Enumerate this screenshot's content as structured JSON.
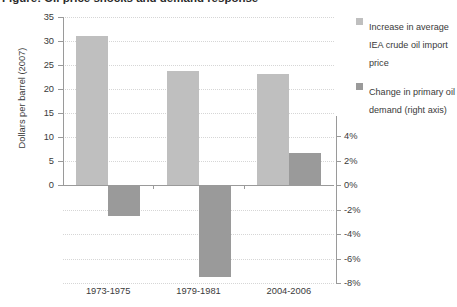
{
  "title": "Figure: Oil price shocks and demand response",
  "axis": {
    "left_label": "Dollars per barrel (2007)",
    "left_ticks": [
      "0",
      "5",
      "10",
      "15",
      "20",
      "25",
      "30",
      "35"
    ],
    "right_ticks": [
      "4%",
      "2%",
      "0%",
      "-2%",
      "-4%",
      "-6%",
      "-8%"
    ]
  },
  "legend": {
    "items": [
      {
        "label": "Increase in average IEA crude oil import price",
        "color": "#bfbfbf",
        "swatch_name": "price-swatch"
      },
      {
        "label": "Change in primary oil demand (right axis)",
        "color": "#9a9a9a",
        "swatch_name": "demand-swatch"
      }
    ]
  },
  "chart_data": {
    "type": "bar",
    "title": "Oil price shocks and demand response",
    "xlabel": "",
    "ylabel": "Dollars per barrel (2007)",
    "y2label": "Change in primary oil demand",
    "categories": [
      "1973-1975",
      "1979-1981",
      "2004-2006"
    ],
    "ylim": [
      0,
      35
    ],
    "y2lim": [
      -8,
      4
    ],
    "yticks": [
      0,
      5,
      10,
      15,
      20,
      25,
      30,
      35
    ],
    "y2ticks": [
      4,
      2,
      0,
      -2,
      -4,
      -6,
      -8
    ],
    "grid": true,
    "legend_position": "right",
    "series": [
      {
        "name": "Increase in average IEA crude oil import price",
        "axis": "left",
        "unit": "dollars per barrel (2007)",
        "color": "#bfbfbf",
        "values": [
          31.0,
          23.7,
          23.1
        ]
      },
      {
        "name": "Change in primary oil demand (right axis)",
        "axis": "right",
        "unit": "percent",
        "color": "#9a9a9a",
        "values": [
          -2.5,
          -7.5,
          2.6
        ]
      }
    ]
  }
}
